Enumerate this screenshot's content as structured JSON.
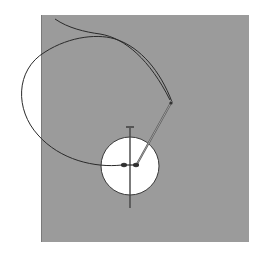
{
  "illustration": {
    "subject": "sewing a button onto fabric",
    "colors": {
      "background": "#ffffff",
      "fabric": "#9b9b9b",
      "fabric_edge": "#7a7a7a",
      "button": "#ffffff",
      "thread": "#2a2a2a",
      "needle": "#555555"
    },
    "elements": [
      "fabric-swatch",
      "button",
      "pin",
      "needle",
      "thread"
    ]
  }
}
